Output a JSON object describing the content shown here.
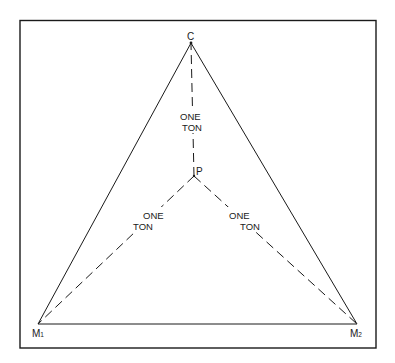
{
  "diagram": {
    "type": "force-triangle",
    "colors": {
      "line": "#1a1a1a",
      "background": "#ffffff"
    },
    "frame": {
      "x1": 20,
      "y1": 20,
      "x2": 376,
      "y2": 348
    },
    "nodes": {
      "C": {
        "label": "C",
        "sub": "",
        "x": 191,
        "y": 43
      },
      "P": {
        "label": "P",
        "sub": "",
        "x": 194,
        "y": 176
      },
      "M1": {
        "label": "M",
        "sub": "1",
        "x": 38,
        "y": 324
      },
      "M2": {
        "label": "M",
        "sub": "2",
        "x": 357,
        "y": 324
      }
    },
    "solid_edges": [
      {
        "from": "C",
        "to": "M1"
      },
      {
        "from": "C",
        "to": "M2"
      },
      {
        "from": "M1",
        "to": "M2"
      }
    ],
    "dashed_edges": [
      {
        "from": "P",
        "to": "C",
        "label_line1": "ONE",
        "label_line2": "TON"
      },
      {
        "from": "P",
        "to": "M1",
        "label_line1": "ONE",
        "label_line2": "TON"
      },
      {
        "from": "P",
        "to": "M2",
        "label_line1": "ONE",
        "label_line2": "TON"
      }
    ]
  }
}
